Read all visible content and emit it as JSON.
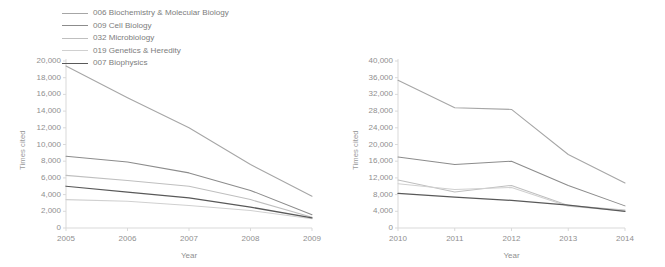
{
  "legend": {
    "items": [
      {
        "label": "006 Biochemistry & Molecular Biology",
        "color": "#a6a6a6"
      },
      {
        "label": "009 Cell Biology",
        "color": "#8c8c8c"
      },
      {
        "label": "032 Microbiology",
        "color": "#bfbfbf"
      },
      {
        "label": "019 Genetics & Heredity",
        "color": "#d0d0d0"
      },
      {
        "label": "007 Biophysics",
        "color": "#595959"
      }
    ]
  },
  "chart_data": [
    {
      "type": "line",
      "title": "",
      "xlabel": "Year",
      "ylabel": "Times cited",
      "x": [
        2005,
        2006,
        2007,
        2008,
        2009
      ],
      "xticklabels": [
        "2005",
        "2006",
        "2007",
        "2008",
        "2009"
      ],
      "yticklabels": [
        "0",
        "2,000",
        "4,000",
        "6,000",
        "8,000",
        "10,000",
        "12,000",
        "14,000",
        "16,000",
        "18,000",
        "20,000"
      ],
      "yticks": [
        0,
        2000,
        4000,
        6000,
        8000,
        10000,
        12000,
        14000,
        16000,
        18000,
        20000
      ],
      "ylim": [
        0,
        20000
      ],
      "xlim": [
        2005,
        2009
      ],
      "grid": false,
      "legend_position": "top-left",
      "series": [
        {
          "name": "006 Biochemistry & Molecular Biology",
          "color": "#a6a6a6",
          "values": [
            19400,
            15600,
            12000,
            7600,
            3800
          ]
        },
        {
          "name": "009 Cell Biology",
          "color": "#8c8c8c",
          "values": [
            8600,
            7900,
            6600,
            4500,
            1600
          ]
        },
        {
          "name": "032 Microbiology",
          "color": "#bfbfbf",
          "values": [
            6300,
            5700,
            5000,
            3400,
            1300
          ]
        },
        {
          "name": "019 Genetics & Heredity",
          "color": "#d0d0d0",
          "values": [
            3400,
            3200,
            2700,
            2100,
            1100
          ]
        },
        {
          "name": "007 Biophysics",
          "color": "#595959",
          "values": [
            5000,
            4300,
            3600,
            2500,
            1200
          ]
        }
      ]
    },
    {
      "type": "line",
      "title": "",
      "xlabel": "Year",
      "ylabel": "Times cited",
      "x": [
        2010,
        2011,
        2012,
        2013,
        2014
      ],
      "xticklabels": [
        "2010",
        "2011",
        "2012",
        "2013",
        "2014"
      ],
      "yticklabels": [
        "0",
        "4,000",
        "8,000",
        "12,000",
        "16,000",
        "20,000",
        "24,000",
        "28,000",
        "32,000",
        "36,000",
        "40,000"
      ],
      "yticks": [
        0,
        4000,
        8000,
        12000,
        16000,
        20000,
        24000,
        28000,
        32000,
        36000,
        40000
      ],
      "ylim": [
        0,
        40000
      ],
      "xlim": [
        2010,
        2014
      ],
      "grid": false,
      "legend_position": "none",
      "series": [
        {
          "name": "006 Biochemistry & Molecular Biology",
          "color": "#a6a6a6",
          "values": [
            35400,
            28800,
            28400,
            17600,
            10800
          ]
        },
        {
          "name": "009 Cell Biology",
          "color": "#8c8c8c",
          "values": [
            17000,
            15200,
            16000,
            10200,
            5300
          ]
        },
        {
          "name": "032 Microbiology",
          "color": "#bfbfbf",
          "values": [
            11500,
            8600,
            10200,
            5400,
            4300
          ]
        },
        {
          "name": "019 Genetics & Heredity",
          "color": "#d0d0d0",
          "values": [
            10600,
            9200,
            9700,
            5200,
            4100
          ]
        },
        {
          "name": "007 Biophysics",
          "color": "#595959",
          "values": [
            8300,
            7400,
            6600,
            5500,
            4000
          ]
        }
      ]
    }
  ]
}
